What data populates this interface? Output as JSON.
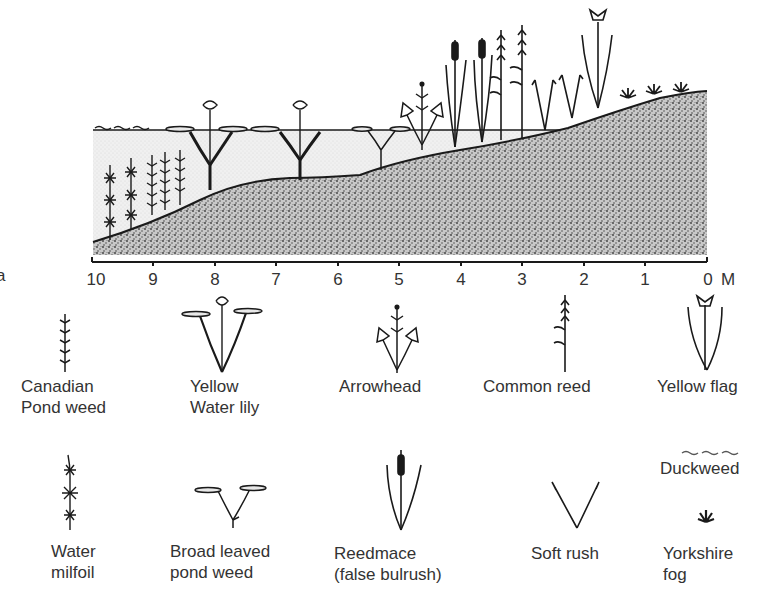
{
  "diagram": {
    "axis": {
      "ticks": [
        "10",
        "9",
        "8",
        "7",
        "6",
        "5",
        "4",
        "3",
        "2",
        "1",
        "0"
      ],
      "unit": "M",
      "edge_fragment": "a"
    },
    "zones": [
      "open water",
      "bank (gravel/soil)"
    ],
    "colors": {
      "ink": "#1a1a1a",
      "water": "#ececec",
      "soil": "#bdbdbd",
      "text": "#333333"
    }
  },
  "legend": {
    "row1": [
      {
        "id": "canadian-pond-weed",
        "lines": [
          "Canadian",
          "Pond weed"
        ]
      },
      {
        "id": "yellow-water-lily",
        "lines": [
          "Yellow",
          "Water lily"
        ]
      },
      {
        "id": "arrowhead",
        "lines": [
          "Arrowhead"
        ]
      },
      {
        "id": "common-reed",
        "lines": [
          "Common reed"
        ]
      },
      {
        "id": "yellow-flag",
        "lines": [
          "Yellow flag"
        ]
      }
    ],
    "row2": [
      {
        "id": "water-milfoil",
        "lines": [
          "Water",
          "milfoil"
        ]
      },
      {
        "id": "broad-leaved-pond-weed",
        "lines": [
          "Broad leaved",
          "pond weed"
        ]
      },
      {
        "id": "reedmace",
        "lines": [
          "Reedmace",
          "(false bulrush)"
        ]
      },
      {
        "id": "soft-rush",
        "lines": [
          "Soft rush"
        ]
      },
      {
        "id": "duckweed",
        "lines": [
          "Duckweed"
        ],
        "symbol": "~~~"
      },
      {
        "id": "yorkshire-fog",
        "lines": [
          "Yorkshire",
          "fog"
        ]
      }
    ]
  }
}
